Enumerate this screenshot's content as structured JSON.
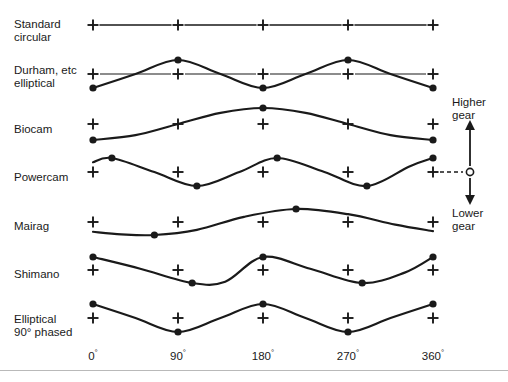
{
  "figure": {
    "width": 508,
    "height": 382,
    "background": "#ffffff",
    "stroke_color": "#1a1a1a",
    "text_color": "#1a1a1a",
    "rule_color": "#b9b9b9"
  },
  "axis": {
    "x_ticks": [
      "0",
      "90",
      "180",
      "270",
      "360"
    ],
    "x_tick_degrees": [
      0,
      90,
      180,
      270,
      360
    ],
    "x_tick_suffix": "°",
    "x_pixel_start": 93,
    "x_pixel_end": 433,
    "tick_label_y": 348
  },
  "annotations": {
    "higher_gear": "Higher\ngear",
    "lower_gear": "Lower\ngear",
    "arrow_x": 470,
    "arrow_top_y": 125,
    "arrow_bottom_y": 200,
    "pivot_y": 172,
    "pivot_marker": "open-circle",
    "dashed_connector_from_x": 440,
    "dashed_connector_to_x": 463
  },
  "chart_data": {
    "type": "line",
    "xlabel": "",
    "ylabel": "",
    "xlim": [
      0,
      360
    ],
    "grid": false,
    "legend": "none",
    "x_tick_labels": [
      "0°",
      "90°",
      "180°",
      "270°",
      "360°"
    ],
    "marker_legend": {
      "plus": "reference (circular) gear level",
      "filled-dot": "profile extreme (max / min gear point)",
      "open-circle": "neutral pivot of higher/lower gear scale"
    },
    "series": [
      {
        "name": "Standard circular",
        "label": "Standard\ncircular",
        "label_x": 14,
        "label_y": 18,
        "baseline_y": 25,
        "amplitude": 0,
        "cycles": 0,
        "shape": "flat",
        "plus_markers_x_deg": [
          0,
          90,
          180,
          270,
          360
        ],
        "dot_markers": [],
        "values_deg": [
          0,
          45,
          90,
          135,
          180,
          225,
          270,
          315,
          360
        ],
        "values": [
          0,
          0,
          0,
          0,
          0,
          0,
          0,
          0,
          0
        ]
      },
      {
        "name": "Durham, etc elliptical",
        "label": "Durham, etc\nelliptical",
        "label_x": 14,
        "label_y": 64,
        "baseline_y": 74,
        "amplitude": 14,
        "cycles": 2,
        "shape": "sine-2cycle-min-at-0",
        "plus_markers_x_deg": [
          0,
          90,
          180,
          270,
          360
        ],
        "dot_markers": [
          {
            "deg": 0,
            "value": -1
          },
          {
            "deg": 90,
            "value": 1
          },
          {
            "deg": 180,
            "value": -1
          },
          {
            "deg": 270,
            "value": 1
          },
          {
            "deg": 360,
            "value": -1
          }
        ],
        "values_deg": [
          0,
          45,
          90,
          135,
          180,
          225,
          270,
          315,
          360
        ],
        "values": [
          -1,
          0,
          1,
          0,
          -1,
          0,
          1,
          0,
          -1
        ]
      },
      {
        "name": "Biocam",
        "label": "Biocam",
        "label_x": 14,
        "label_y": 123,
        "baseline_y": 124,
        "amplitude": 16,
        "cycles": 1,
        "shape": "sine-1cycle-min-at-0",
        "plus_markers_x_deg": [
          0,
          90,
          180,
          270,
          360
        ],
        "dot_markers": [
          {
            "deg": 0,
            "value": -1
          },
          {
            "deg": 180,
            "value": 1
          },
          {
            "deg": 360,
            "value": -1
          }
        ],
        "values_deg": [
          0,
          45,
          90,
          135,
          180,
          225,
          270,
          315,
          360
        ],
        "values": [
          -1,
          -0.7,
          0,
          0.7,
          1,
          0.7,
          0,
          -0.7,
          -1
        ]
      },
      {
        "name": "Powercam",
        "label": "Powercam",
        "label_x": 14,
        "label_y": 171,
        "baseline_y": 172,
        "amplitude": 14,
        "cycles": 2,
        "phase_deg": -20,
        "shape": "sine-2cycle-max-near-20",
        "plus_markers_x_deg": [
          0,
          90,
          180,
          270,
          360
        ],
        "dot_markers": [
          {
            "deg": 20,
            "value": 1
          },
          {
            "deg": 110,
            "value": -1
          },
          {
            "deg": 195,
            "value": 1
          },
          {
            "deg": 290,
            "value": -1
          },
          {
            "deg": 360,
            "value": 1
          }
        ],
        "values_deg": [
          0,
          20,
          65,
          110,
          155,
          195,
          245,
          290,
          335,
          360
        ],
        "values": [
          0.7,
          1,
          0,
          -1,
          0,
          1,
          0,
          -1,
          0.4,
          1
        ]
      },
      {
        "name": "Mairag",
        "label": "Mairag",
        "label_x": 14,
        "label_y": 220,
        "baseline_y": 222,
        "amplitude": 13,
        "cycles": 1,
        "phase_deg": 65,
        "shape": "sine-1cycle-min-near-65",
        "plus_markers_x_deg": [
          0,
          90,
          180,
          270,
          360
        ],
        "dot_markers": [
          {
            "deg": 65,
            "value": -1
          },
          {
            "deg": 215,
            "value": 1
          }
        ],
        "values_deg": [
          0,
          30,
          65,
          110,
          160,
          215,
          270,
          320,
          360
        ],
        "values": [
          -0.75,
          -0.95,
          -1,
          -0.6,
          0.4,
          1,
          0.6,
          -0.2,
          -0.7
        ]
      },
      {
        "name": "Shimano",
        "label": "Shimano",
        "label_x": 14,
        "label_y": 268,
        "baseline_y": 270,
        "amplitude": 13,
        "cycles": 2,
        "shape": "cosine-2cycle-max-at-0-flat-troughs",
        "plus_markers_x_deg": [
          0,
          90,
          180,
          270,
          360
        ],
        "dot_markers": [
          {
            "deg": 0,
            "value": 1
          },
          {
            "deg": 105,
            "value": -1
          },
          {
            "deg": 180,
            "value": 1
          },
          {
            "deg": 285,
            "value": -1
          },
          {
            "deg": 360,
            "value": 1
          }
        ],
        "values_deg": [
          0,
          50,
          105,
          140,
          180,
          230,
          285,
          330,
          360
        ],
        "values": [
          1,
          0.1,
          -1,
          -0.9,
          1,
          0.1,
          -1,
          -0.2,
          1
        ]
      },
      {
        "name": "Elliptical 90 phased",
        "label": "Elliptical\n90° phased",
        "label_x": 14,
        "label_y": 313,
        "baseline_y": 318,
        "amplitude": 14,
        "cycles": 2,
        "shape": "cosine-2cycle-max-at-0",
        "plus_markers_x_deg": [
          0,
          90,
          180,
          270,
          360
        ],
        "dot_markers": [
          {
            "deg": 0,
            "value": 1
          },
          {
            "deg": 90,
            "value": -1
          },
          {
            "deg": 180,
            "value": 1
          },
          {
            "deg": 270,
            "value": -1
          },
          {
            "deg": 360,
            "value": 1
          }
        ],
        "values_deg": [
          0,
          45,
          90,
          135,
          180,
          225,
          270,
          315,
          360
        ],
        "values": [
          1,
          0,
          -1,
          0,
          1,
          0,
          -1,
          0,
          1
        ]
      }
    ]
  }
}
